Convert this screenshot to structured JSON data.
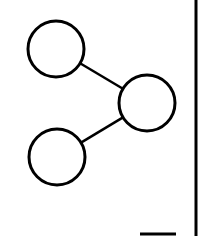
{
  "diagram": {
    "type": "node-link",
    "stroke_color": "#000000",
    "background": "#ffffff",
    "nodes": [
      {
        "id": "top-left",
        "cx": 56,
        "cy": 49,
        "r": 28,
        "label": ""
      },
      {
        "id": "right",
        "cx": 147,
        "cy": 103,
        "r": 28,
        "label": ""
      },
      {
        "id": "bottom-left",
        "cx": 57,
        "cy": 157,
        "r": 28,
        "label": ""
      }
    ],
    "edges": [
      {
        "from": "top-left",
        "to": "right"
      },
      {
        "from": "bottom-left",
        "to": "right"
      }
    ]
  },
  "frame": {
    "right_border_x": 196,
    "bottom_bar": {
      "x1": 140,
      "x2": 176,
      "y": 234
    }
  }
}
